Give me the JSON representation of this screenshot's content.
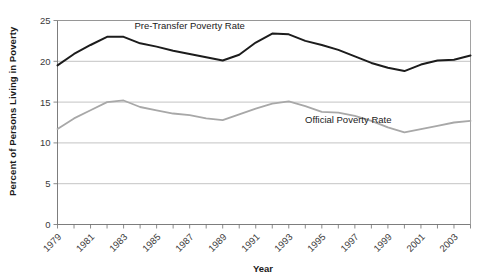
{
  "chart_data": {
    "type": "line",
    "title": "",
    "xlabel": "Year",
    "ylabel": "Percent of Persons Living in Poverty",
    "ylim": [
      0,
      25
    ],
    "yticks": [
      0,
      5,
      10,
      15,
      20,
      25
    ],
    "ytick_labels": [
      "0",
      "5",
      "10",
      "15",
      "20",
      "25"
    ],
    "grid": true,
    "legend_position": "inline-annotations",
    "x": [
      1979,
      1980,
      1981,
      1982,
      1983,
      1984,
      1985,
      1986,
      1987,
      1988,
      1989,
      1990,
      1991,
      1992,
      1993,
      1994,
      1995,
      1996,
      1997,
      1998,
      1999,
      2000,
      2001,
      2002,
      2003,
      2004
    ],
    "xtick_labels": [
      "1979",
      "1981",
      "1983",
      "1985",
      "1987",
      "1989",
      "1991",
      "1993",
      "1995",
      "1997",
      "1999",
      "2001",
      "2003"
    ],
    "xtick_values": [
      1979,
      1981,
      1983,
      1985,
      1987,
      1989,
      1991,
      1993,
      1995,
      1997,
      1999,
      2001,
      2003
    ],
    "xlim": [
      1979,
      2004
    ],
    "series": [
      {
        "name": "Pre-Transfer Poverty Rate",
        "color": "#1c1c1c",
        "values": [
          19.5,
          20.9,
          22.0,
          23.0,
          23.0,
          22.2,
          21.8,
          21.3,
          20.9,
          20.5,
          20.1,
          20.8,
          22.3,
          23.4,
          23.3,
          22.5,
          22.0,
          21.4,
          20.6,
          19.8,
          19.2,
          18.8,
          19.6,
          20.1,
          20.2,
          20.7
        ]
      },
      {
        "name": "Official Poverty Rate",
        "color": "#a8a8a8",
        "values": [
          11.7,
          13.0,
          14.0,
          15.0,
          15.2,
          14.4,
          14.0,
          13.6,
          13.4,
          13.0,
          12.8,
          13.5,
          14.2,
          14.8,
          15.1,
          14.5,
          13.8,
          13.7,
          13.3,
          12.7,
          11.9,
          11.3,
          11.7,
          12.1,
          12.5,
          12.7
        ]
      }
    ],
    "annotations": [
      {
        "text": "Pre-Transfer Poverty Rate",
        "x": 1987.0,
        "y": 23.9
      },
      {
        "text": "Official Poverty Rate",
        "x": 1996.6,
        "y": 12.5
      }
    ],
    "colors": {
      "background": "#ffffff",
      "pre_transfer": "#1c1c1c",
      "official": "#a8a8a8",
      "grid": "#b4b4b4",
      "axis": "#6e6e6e",
      "text": "#1a1a1a"
    }
  }
}
